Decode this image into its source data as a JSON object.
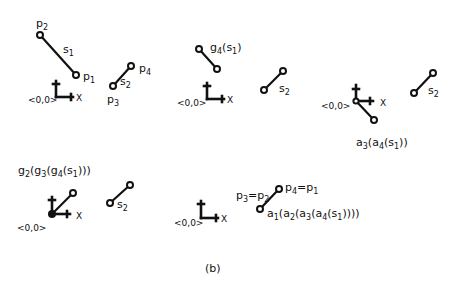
{
  "figure": {
    "caption": "(b)",
    "ink_color": "#111111",
    "background": "#ffffff"
  },
  "panels": [
    {
      "id": "panel-1",
      "origin_label": "<0,0>",
      "x_axis_label": "X",
      "segments": [
        {
          "name": "s",
          "sub": "1",
          "endpoints": [
            {
              "name": "p",
              "sub": "2"
            },
            {
              "name": "p",
              "sub": "1"
            }
          ]
        },
        {
          "name": "s",
          "sub": "2",
          "endpoints": [
            {
              "name": "p",
              "sub": "3"
            },
            {
              "name": "p",
              "sub": "4"
            }
          ]
        }
      ]
    },
    {
      "id": "panel-2",
      "origin_label": "<0,0>",
      "x_axis_label": "X",
      "transform_label": {
        "g": "g",
        "g_sub": "4",
        "arg": "s",
        "arg_sub": "1",
        "text": "g4(s1)"
      },
      "segments": [
        {
          "name": "s",
          "sub": "2"
        }
      ]
    },
    {
      "id": "panel-3",
      "origin_label": "<0,0>",
      "x_axis_label": "X",
      "transform_label": {
        "text": "a3(a4(s1))",
        "parts": [
          "a",
          "3",
          "(a",
          "4",
          "(s",
          "1",
          "))"
        ]
      },
      "segments": [
        {
          "name": "s",
          "sub": "2"
        }
      ]
    },
    {
      "id": "panel-4",
      "origin_label": "<0,0>",
      "x_axis_label": "X",
      "transform_label": {
        "text": "g2(g3(g4(s1)))",
        "parts": [
          "g",
          "2",
          "(g",
          "3",
          "(g",
          "4",
          "(s",
          "1",
          ")))"
        ]
      },
      "segments": [
        {
          "name": "s",
          "sub": "2"
        }
      ]
    },
    {
      "id": "panel-5",
      "origin_label": "<0,0>",
      "x_axis_label": "X",
      "equalities": [
        {
          "text": "p3=p2",
          "parts": [
            "p",
            "3",
            "=p",
            "2"
          ]
        },
        {
          "text": "p4=p1",
          "parts": [
            "p",
            "4",
            "=p",
            "1"
          ]
        }
      ],
      "transform_label": {
        "text": "a1(a2(a3(a4(s1))))",
        "parts": [
          "a",
          "1",
          "(a",
          "2",
          "(a",
          "3",
          "(a",
          "4",
          "(s",
          "1",
          "))))"
        ]
      }
    }
  ]
}
